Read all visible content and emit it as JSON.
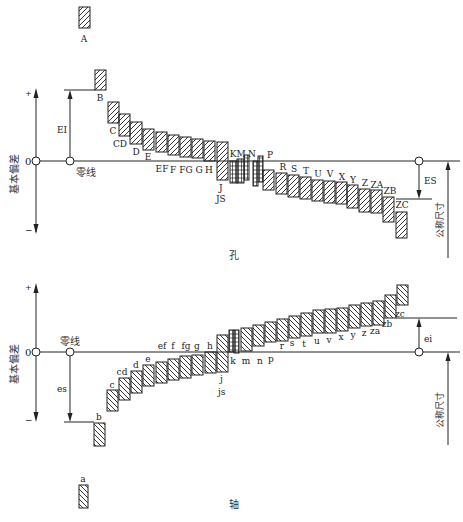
{
  "hole_section": {
    "caption": "孔",
    "axis_label": "基本偏差",
    "plus": "+",
    "minus": "−",
    "zero": "0",
    "zero_line_label": "零线",
    "lower_dev_label": "EI",
    "upper_dev_label": "ES",
    "nominal_size_label": "公称尺寸",
    "bars": [
      {
        "name": "A",
        "x": 79,
        "y1": 7,
        "y2": 28,
        "w": 11,
        "lx": 84,
        "ly": 42,
        "hatch": "fwd"
      },
      {
        "name": "B",
        "x": 95,
        "y1": 70,
        "y2": 90,
        "w": 11,
        "lx": 100,
        "ly": 101,
        "hatch": "fwd"
      },
      {
        "name": "C",
        "x": 108,
        "y1": 102,
        "y2": 123,
        "w": 11,
        "lx": 113,
        "ly": 134,
        "hatch": "fwd"
      },
      {
        "name": "CD",
        "x": 119,
        "y1": 114,
        "y2": 136,
        "w": 11,
        "lx": 120,
        "ly": 147,
        "hatch": "fwd"
      },
      {
        "name": "D",
        "x": 130,
        "y1": 122,
        "y2": 144,
        "w": 12,
        "lx": 136,
        "ly": 155,
        "hatch": "fwd"
      },
      {
        "name": "E",
        "x": 143,
        "y1": 129,
        "y2": 150,
        "w": 11,
        "lx": 148,
        "ly": 160,
        "hatch": "fwd"
      },
      {
        "name": "EF",
        "x": 156,
        "y1": 132,
        "y2": 152,
        "w": 11,
        "lx": 162,
        "ly": 172,
        "hatch": "fwd"
      },
      {
        "name": "F",
        "x": 168,
        "y1": 135,
        "y2": 155,
        "w": 11,
        "lx": 173,
        "ly": 173,
        "hatch": "fwd"
      },
      {
        "name": "FG",
        "x": 180,
        "y1": 137,
        "y2": 157,
        "w": 11,
        "lx": 186,
        "ly": 173,
        "hatch": "fwd"
      },
      {
        "name": "G",
        "x": 192,
        "y1": 139,
        "y2": 158,
        "w": 11,
        "lx": 199,
        "ly": 173,
        "hatch": "fwd"
      },
      {
        "name": "H",
        "x": 204,
        "y1": 141,
        "y2": 161,
        "w": 11,
        "lx": 209,
        "ly": 173,
        "hatch": "fwd"
      },
      {
        "name": "J/JS",
        "x": 217,
        "y1": 142,
        "y2": 180,
        "w": 11,
        "lx": 222,
        "ly": 190,
        "hatch": "fwd"
      },
      {
        "name": "K",
        "x": 230,
        "y1": 161,
        "y2": 183,
        "w": 7,
        "lx": 233,
        "ly": 157,
        "hatch": "grid"
      },
      {
        "name": "M",
        "x": 237,
        "y1": 159,
        "y2": 183,
        "w": 7,
        "lx": 241,
        "ly": 157,
        "hatch": "grid"
      },
      {
        "name": "M2",
        "x": 244,
        "y1": 155,
        "y2": 180,
        "w": 5,
        "lx": 0,
        "ly": 0,
        "hatch": "grid"
      },
      {
        "name": "N",
        "x": 253,
        "y1": 161,
        "y2": 186,
        "w": 5,
        "lx": 252,
        "ly": 157,
        "hatch": "grid"
      },
      {
        "name": "N2",
        "x": 258,
        "y1": 156,
        "y2": 182,
        "w": 5,
        "lx": 0,
        "ly": 0,
        "hatch": "grid"
      },
      {
        "name": "P",
        "x": 263,
        "y1": 170,
        "y2": 190,
        "w": 11,
        "lx": 270,
        "ly": 158,
        "hatch": "fwd"
      },
      {
        "name": "R",
        "x": 276,
        "y1": 173,
        "y2": 194,
        "w": 11,
        "lx": 283,
        "ly": 170,
        "hatch": "fwd"
      },
      {
        "name": "S",
        "x": 288,
        "y1": 175,
        "y2": 197,
        "w": 11,
        "lx": 294,
        "ly": 172,
        "hatch": "fwd"
      },
      {
        "name": "T",
        "x": 300,
        "y1": 177,
        "y2": 199,
        "w": 11,
        "lx": 306,
        "ly": 174,
        "hatch": "fwd"
      },
      {
        "name": "U",
        "x": 312,
        "y1": 180,
        "y2": 201,
        "w": 11,
        "lx": 318,
        "ly": 177,
        "hatch": "fwd"
      },
      {
        "name": "V",
        "x": 324,
        "y1": 181,
        "y2": 203,
        "w": 11,
        "lx": 330,
        "ly": 177,
        "hatch": "fwd"
      },
      {
        "name": "X",
        "x": 336,
        "y1": 182,
        "y2": 204,
        "w": 11,
        "lx": 342,
        "ly": 180,
        "hatch": "fwd"
      },
      {
        "name": "Y",
        "x": 347,
        "y1": 185,
        "y2": 208,
        "w": 11,
        "lx": 353,
        "ly": 183,
        "hatch": "fwd"
      },
      {
        "name": "Z",
        "x": 359,
        "y1": 189,
        "y2": 212,
        "w": 11,
        "lx": 365,
        "ly": 186,
        "hatch": "fwd"
      },
      {
        "name": "ZA",
        "x": 371,
        "y1": 190,
        "y2": 213,
        "w": 11,
        "lx": 377,
        "ly": 188,
        "hatch": "fwd"
      },
      {
        "name": "ZB",
        "x": 383,
        "y1": 197,
        "y2": 222,
        "w": 11,
        "lx": 390,
        "ly": 194,
        "hatch": "fwd"
      },
      {
        "name": "ZC",
        "x": 396,
        "y1": 212,
        "y2": 238,
        "w": 11,
        "lx": 402,
        "ly": 208,
        "hatch": "fwd"
      }
    ]
  },
  "shaft_section": {
    "caption": "轴",
    "axis_label": "基本偏差",
    "plus": "+",
    "minus": "−",
    "zero": "0",
    "zero_line_label": "零线",
    "upper_dev_label": "es",
    "lower_dev_label": "ei",
    "nominal_size_label": "公称尺寸",
    "bars": [
      {
        "name": "a",
        "x": 79,
        "y1": 485,
        "y2": 508,
        "w": 9,
        "lx": 83,
        "ly": 482,
        "hatch": "back"
      },
      {
        "name": "b",
        "x": 94,
        "y1": 423,
        "y2": 446,
        "w": 11,
        "lx": 99,
        "ly": 420,
        "hatch": "back"
      },
      {
        "name": "c",
        "x": 107,
        "y1": 390,
        "y2": 411,
        "w": 11,
        "lx": 112,
        "ly": 388,
        "hatch": "back"
      },
      {
        "name": "cd",
        "x": 119,
        "y1": 378,
        "y2": 400,
        "w": 11,
        "lx": 122,
        "ly": 375,
        "hatch": "back"
      },
      {
        "name": "d",
        "x": 131,
        "y1": 371,
        "y2": 393,
        "w": 11,
        "lx": 136,
        "ly": 368,
        "hatch": "back"
      },
      {
        "name": "e",
        "x": 143,
        "y1": 365,
        "y2": 386,
        "w": 11,
        "lx": 148,
        "ly": 362,
        "hatch": "back"
      },
      {
        "name": "ef",
        "x": 156,
        "y1": 362,
        "y2": 383,
        "w": 11,
        "lx": 162,
        "ly": 349,
        "hatch": "back"
      },
      {
        "name": "f",
        "x": 168,
        "y1": 359,
        "y2": 380,
        "w": 11,
        "lx": 173,
        "ly": 349,
        "hatch": "back"
      },
      {
        "name": "fg",
        "x": 180,
        "y1": 356,
        "y2": 378,
        "w": 11,
        "lx": 186,
        "ly": 349,
        "hatch": "back"
      },
      {
        "name": "g",
        "x": 192,
        "y1": 355,
        "y2": 375,
        "w": 11,
        "lx": 197,
        "ly": 349,
        "hatch": "back"
      },
      {
        "name": "h",
        "x": 205,
        "y1": 352,
        "y2": 373,
        "w": 11,
        "lx": 210,
        "ly": 349,
        "hatch": "back"
      },
      {
        "name": "j/js",
        "x": 217,
        "y1": 335,
        "y2": 372,
        "w": 11,
        "lx": 222,
        "ly": 382,
        "hatch": "back"
      },
      {
        "name": "k",
        "x": 229,
        "y1": 330,
        "y2": 352,
        "w": 5,
        "lx": 233,
        "ly": 364,
        "hatch": "grid"
      },
      {
        "name": "k2",
        "x": 234,
        "y1": 330,
        "y2": 353,
        "w": 5,
        "lx": 0,
        "ly": 0,
        "hatch": "grid"
      },
      {
        "name": "m",
        "x": 241,
        "y1": 328,
        "y2": 351,
        "w": 11,
        "lx": 246,
        "ly": 364,
        "hatch": "back"
      },
      {
        "name": "n",
        "x": 253,
        "y1": 325,
        "y2": 346,
        "w": 11,
        "lx": 260,
        "ly": 364,
        "hatch": "back"
      },
      {
        "name": "p",
        "x": 265,
        "y1": 322,
        "y2": 342,
        "w": 11,
        "lx": 271,
        "ly": 362,
        "hatch": "back"
      },
      {
        "name": "r",
        "x": 277,
        "y1": 319,
        "y2": 341,
        "w": 11,
        "lx": 282,
        "ly": 349,
        "hatch": "back"
      },
      {
        "name": "s",
        "x": 289,
        "y1": 316,
        "y2": 338,
        "w": 11,
        "lx": 292,
        "ly": 346,
        "hatch": "back"
      },
      {
        "name": "t",
        "x": 301,
        "y1": 313,
        "y2": 336,
        "w": 11,
        "lx": 304,
        "ly": 347,
        "hatch": "back"
      },
      {
        "name": "u",
        "x": 313,
        "y1": 310,
        "y2": 333,
        "w": 11,
        "lx": 317,
        "ly": 344,
        "hatch": "back"
      },
      {
        "name": "v",
        "x": 325,
        "y1": 309,
        "y2": 333,
        "w": 11,
        "lx": 329,
        "ly": 343,
        "hatch": "back"
      },
      {
        "name": "x",
        "x": 337,
        "y1": 308,
        "y2": 331,
        "w": 11,
        "lx": 341,
        "ly": 340,
        "hatch": "back"
      },
      {
        "name": "y",
        "x": 349,
        "y1": 305,
        "y2": 328,
        "w": 11,
        "lx": 353,
        "ly": 338,
        "hatch": "back"
      },
      {
        "name": "z",
        "x": 361,
        "y1": 303,
        "y2": 326,
        "w": 11,
        "lx": 364,
        "ly": 336,
        "hatch": "back"
      },
      {
        "name": "za",
        "x": 373,
        "y1": 301,
        "y2": 325,
        "w": 11,
        "lx": 375,
        "ly": 334,
        "hatch": "back"
      },
      {
        "name": "zb",
        "x": 385,
        "y1": 295,
        "y2": 318,
        "w": 11,
        "lx": 387,
        "ly": 327,
        "hatch": "back"
      },
      {
        "name": "zc",
        "x": 397,
        "y1": 285,
        "y2": 305,
        "w": 11,
        "lx": 400,
        "ly": 317,
        "hatch": "back"
      }
    ]
  }
}
